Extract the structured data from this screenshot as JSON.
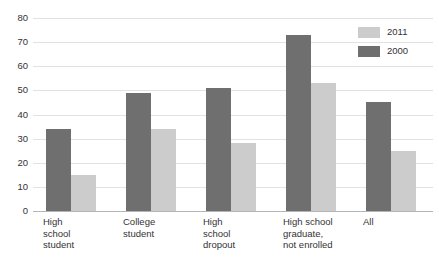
{
  "chart_data": {
    "type": "bar",
    "title": "",
    "subtitle": "",
    "xlabel": "",
    "ylabel": "",
    "ylim": [
      0,
      80
    ],
    "ytick_step": 10,
    "yticks": [
      "80",
      "70",
      "60",
      "50",
      "40",
      "30",
      "20",
      "10",
      "0"
    ],
    "grid": true,
    "legend_position": "top-right",
    "categories": [
      "High\nschool\nstudent",
      "College\nstudent",
      "High\nschool\ndropout",
      "High school\ngraduate,\nnot enrolled",
      "All"
    ],
    "series": [
      {
        "name": "2000",
        "color": "#6f6f6f",
        "values": [
          34,
          49,
          51,
          73,
          45
        ]
      },
      {
        "name": "2011",
        "color": "#cccccc",
        "values": [
          15,
          34,
          28,
          53,
          25
        ]
      }
    ]
  },
  "legend": {
    "entries": [
      {
        "label": "2011",
        "color": "#cccccc"
      },
      {
        "label": "2000",
        "color": "#6f6f6f"
      }
    ]
  },
  "colors": {
    "series_2000": "#6f6f6f",
    "series_2011": "#cccccc",
    "gridline": "#e2e2e2",
    "axis": "#b5b5b5",
    "text": "#333333",
    "background": "#ffffff"
  }
}
